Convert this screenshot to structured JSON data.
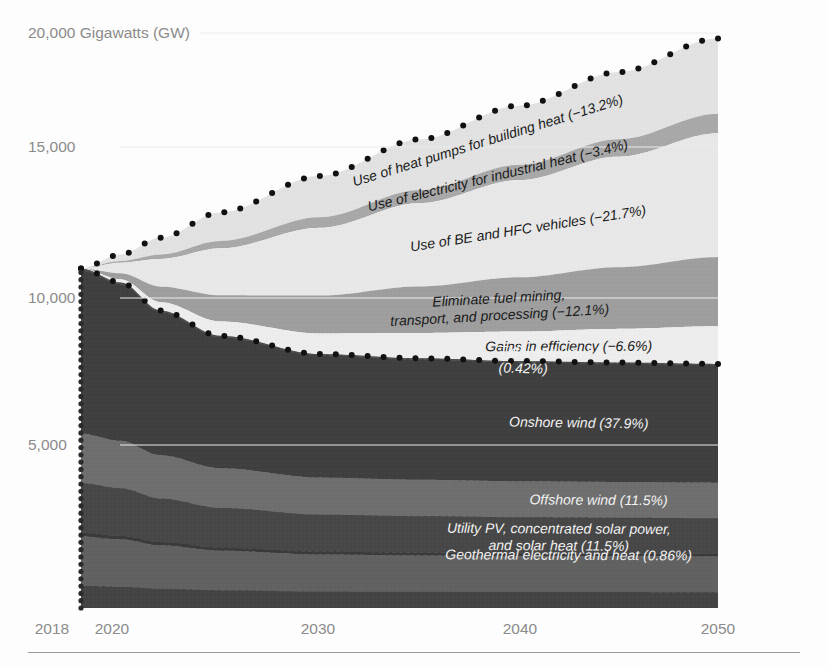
{
  "chart_data": {
    "type": "area",
    "title": "",
    "ylabel": "20,000 Gigawatts (GW)",
    "xlabel": "",
    "grid": false,
    "legend_position": "inline-labels",
    "xlim": [
      2018,
      2050
    ],
    "ylim": [
      0,
      20600
    ],
    "x_ticks": [
      "2018",
      "2020",
      "2030",
      "2040",
      "2050"
    ],
    "x_tick_values": [
      2018,
      2020,
      2030,
      2040,
      2050
    ],
    "y_ticks": [
      "20,000 Gigawatts (GW)",
      "15,000",
      "10,000",
      "5,000"
    ],
    "y_tick_values": [
      20000,
      15000,
      10000,
      5000
    ],
    "x": [
      2018,
      2020,
      2022,
      2025,
      2030,
      2035,
      2040,
      2045,
      2050
    ],
    "bau_total": [
      12100,
      12600,
      13200,
      14100,
      15400,
      16700,
      17900,
      19100,
      20300
    ],
    "wws_total": [
      12100,
      11600,
      10600,
      9700,
      9050,
      8900,
      8800,
      8750,
      8700
    ],
    "efficiency_series": [
      {
        "name": "Use of heat pumps for building heat",
        "pct": "-13.2%",
        "label": "Use of heat pumps for building heat (−13.2%)",
        "share": 0.132,
        "shade": "#e2e2e2"
      },
      {
        "name": "Use of electricity for industrial heat",
        "pct": "-3.4%",
        "label": "Use of electricity for industrial heat (−3.4%)",
        "share": 0.034,
        "shade": "#a8a8a8"
      },
      {
        "name": "Use of BE and HFC vehicles",
        "pct": "-21.7%",
        "label": "Use of BE and HFC vehicles (−21.7%)",
        "share": 0.217,
        "shade": "#e8e8e8"
      },
      {
        "name": "Eliminate fuel mining, transport, and processing",
        "pct": "-12.1%",
        "label": "Eliminate fuel mining,|transport, and processing (−12.1%)",
        "share": 0.121,
        "shade": "#9e9e9e"
      },
      {
        "name": "Gains in efficiency",
        "pct": "-6.6%",
        "label": "Gains in efficiency (−6.6%)",
        "share": 0.066,
        "shade": "#ededed"
      }
    ],
    "wws_series": [
      {
        "name": "Tidal and wave",
        "pct": "0.42%",
        "label": "Tidal and wave|(0.42%)",
        "share": 0.0042,
        "shade": "#4f4f4f"
      },
      {
        "name": "Onshore wind",
        "pct": "37.9%",
        "label": "Onshore wind (37.9%)",
        "share": 0.379,
        "shade": "#3f3f3f"
      },
      {
        "name": "Offshore wind",
        "pct": "11.5%",
        "label": "Offshore wind (11.5%)",
        "share": 0.115,
        "shade": "#6e6e6e"
      },
      {
        "name": "Utility PV, concentrated solar power, and solar heat",
        "pct": "11.5%",
        "label": "Utility PV, concentrated solar power,|and solar heat (11.5%)",
        "share": 0.115,
        "shade": "#474747"
      },
      {
        "name": "Geothermal electricity and heat",
        "pct": "0.86%",
        "label": "Geothermal electricity and heat (0.86%)",
        "share": 0.0086,
        "shade": "#3a3a3a"
      },
      {
        "name": "Rooftop PV",
        "pct": "11.5%",
        "label": "Rooftop PV (11.5%)",
        "share": 0.115,
        "shade": "#616161"
      },
      {
        "name": "Hydroelectric",
        "pct": "5.1%",
        "label": "Hydroelectric (5.1%)",
        "share": 0.051,
        "shade": "#444444"
      }
    ],
    "base_region": {
      "name": "Fossil fuels, nuclear, and biofuels/bioenergy",
      "label": "Fossil fuels,|nuclear, and|biofuels/bioenergy",
      "shade": "#767676"
    },
    "annotations": [
      {
        "name": "proposed-efficiencies",
        "label": "Proposed|efficiencies",
        "x": 2030
      },
      {
        "name": "proposed-changes-to-fuel-sources",
        "label": "Proposed changes|to fuel sources",
        "x": 2030
      }
    ],
    "endpoint_labels": [
      {
        "name": "bau",
        "value": "20.3 TW",
        "lines": [
          "Projected",
          "BAU"
        ]
      },
      {
        "name": "wws",
        "value": "8.7 TW",
        "lines": [
          "Projected",
          "100%",
          "WWS"
        ]
      }
    ],
    "colors": {
      "bau_curve": "#111111",
      "wws_curve": "#111111",
      "base_fill": "#767676",
      "axis_text": "#8b8b8b",
      "background": "#fdfdfd"
    }
  }
}
